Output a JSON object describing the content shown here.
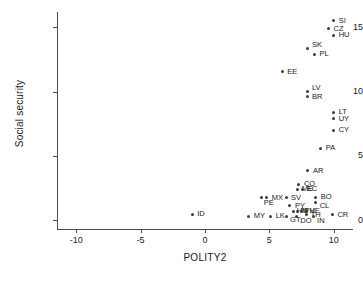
{
  "chart_data": {
    "type": "scatter",
    "title": "",
    "xlabel": "POLITY2",
    "ylabel": "Social security",
    "xlim": [
      -11.5,
      11.5
    ],
    "ylim": [
      -0.7,
      16.2
    ],
    "xticks": [
      -10,
      -5,
      0,
      5,
      10
    ],
    "xtick_labels": [
      "-10",
      "-5",
      "0",
      "5",
      "10"
    ],
    "yticks": [
      0,
      5,
      10,
      15
    ],
    "ytick_labels": [
      "0",
      "5",
      "10",
      "15"
    ],
    "grid": false,
    "legend": "none",
    "marker_color": "#3c3c3c",
    "axis_color": "#4a4a4a",
    "points": [
      {
        "label": "SI",
        "x": 10.0,
        "y": 15.5,
        "lx": 5,
        "ly": -4
      },
      {
        "label": "CZ",
        "x": 9.6,
        "y": 14.9,
        "lx": 5,
        "ly": -4
      },
      {
        "label": "HU",
        "x": 10.0,
        "y": 14.4,
        "lx": 5,
        "ly": -4
      },
      {
        "label": "SK",
        "x": 8.0,
        "y": 13.35,
        "lx": 4,
        "ly": -8
      },
      {
        "label": "PL",
        "x": 8.5,
        "y": 12.9,
        "lx": 5,
        "ly": -4
      },
      {
        "label": "EE",
        "x": 6.0,
        "y": 11.55,
        "lx": 5,
        "ly": -4
      },
      {
        "label": "LV",
        "x": 8.0,
        "y": 10.0,
        "lx": 4,
        "ly": -8
      },
      {
        "label": "BR",
        "x": 8.0,
        "y": 9.65,
        "lx": 4,
        "ly": -3
      },
      {
        "label": "LT",
        "x": 10.0,
        "y": 8.4,
        "lx": 5,
        "ly": -4
      },
      {
        "label": "UY",
        "x": 10.0,
        "y": 7.9,
        "lx": 5,
        "ly": -4
      },
      {
        "label": "CY",
        "x": 10.0,
        "y": 7.0,
        "lx": 5,
        "ly": -4
      },
      {
        "label": "PA",
        "x": 9.0,
        "y": 5.6,
        "lx": 5,
        "ly": -4
      },
      {
        "label": "AR",
        "x": 8.0,
        "y": 3.85,
        "lx": 5,
        "ly": -4
      },
      {
        "label": "CO",
        "x": 7.3,
        "y": 2.8,
        "lx": 5,
        "ly": -4
      },
      {
        "label": "ME",
        "x": 7.2,
        "y": 2.4,
        "lx": 4,
        "ly": -4
      },
      {
        "label": "EC",
        "x": 7.6,
        "y": 2.4,
        "lx": 4,
        "ly": -4
      },
      {
        "label": "MX",
        "x": 4.8,
        "y": 1.75,
        "lx": 5,
        "ly": -4
      },
      {
        "label": "PE",
        "x": 4.4,
        "y": 1.75,
        "lx": 2,
        "ly": 1
      },
      {
        "label": "SV",
        "x": 6.3,
        "y": 1.75,
        "lx": 5,
        "ly": -4
      },
      {
        "label": "BO",
        "x": 8.6,
        "y": 1.75,
        "lx": 5,
        "ly": -5
      },
      {
        "label": "CL",
        "x": 8.6,
        "y": 1.4,
        "lx": 4,
        "ly": 0
      },
      {
        "label": "PY",
        "x": 6.6,
        "y": 1.1,
        "lx": 5,
        "ly": -4
      },
      {
        "label": "HN",
        "x": 6.9,
        "y": 0.7,
        "lx": 3,
        "ly": -4
      },
      {
        "label": "NI",
        "x": 7.2,
        "y": 0.7,
        "lx": 3,
        "ly": -4
      },
      {
        "label": "PH",
        "x": 7.5,
        "y": 0.7,
        "lx": 3,
        "ly": -4
      },
      {
        "label": "VE",
        "x": 7.9,
        "y": 0.7,
        "lx": 3,
        "ly": -4
      },
      {
        "label": "MY",
        "x": 3.4,
        "y": 0.3,
        "lx": 5,
        "ly": -4
      },
      {
        "label": "ID",
        "x": -1.0,
        "y": 0.45,
        "lx": 5,
        "ly": -4
      },
      {
        "label": "LK",
        "x": 5.1,
        "y": 0.3,
        "lx": 5,
        "ly": -4
      },
      {
        "label": "GT",
        "x": 6.3,
        "y": 0.3,
        "lx": 4,
        "ly": 0
      },
      {
        "label": "DO",
        "x": 7.1,
        "y": 0.3,
        "lx": 4,
        "ly": 1
      },
      {
        "label": "TH",
        "x": 7.9,
        "y": 0.45,
        "lx": 4,
        "ly": -3
      },
      {
        "label": "IN",
        "x": 8.4,
        "y": 0.3,
        "lx": 4,
        "ly": 1
      },
      {
        "label": "CR",
        "x": 9.9,
        "y": 0.4,
        "lx": 5,
        "ly": -4
      }
    ]
  }
}
